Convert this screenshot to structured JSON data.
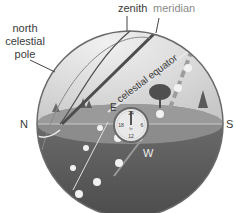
{
  "labels": {
    "north_celestial_pole_line1": "north",
    "north_celestial_pole_line2": "celestial",
    "north_celestial_pole_line3": "pole",
    "zenith": "zenith",
    "meridian": "meridian",
    "celestial_equator": "celestial equator",
    "north": "N",
    "south": "S",
    "east": "E",
    "west": "W"
  },
  "clock": {
    "top": "24",
    "left": "18",
    "right": "6",
    "bottom": "12",
    "center": "hr"
  },
  "colors": {
    "sky": "#d9d9d9",
    "horizon_plane": "#8a8a8a",
    "below_horizon": "#5a5a5a",
    "outline": "#555555",
    "sun_dot": "#f2f2f2"
  }
}
